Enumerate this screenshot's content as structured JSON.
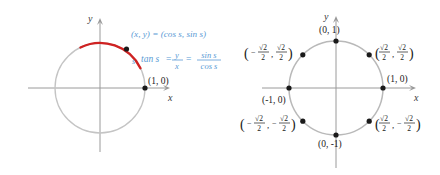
{
  "figure": {
    "colors": {
      "circle": "#bfbfbf",
      "axis": "#999999",
      "arc": "#d02020",
      "annotation_text": "#5b9bd5",
      "point": "#1a1a1a",
      "label_text": "#1a1a1a",
      "background": "#ffffff"
    }
  },
  "left_panel": {
    "name": "unit-circle-arc-diagram",
    "axes": {
      "x_label": "x",
      "y_label": "y"
    },
    "points": [
      {
        "id": "terminal-point",
        "label": "(x, y) = (cos s, sin s)",
        "x": -0.42,
        "y": 0.85
      },
      {
        "id": "initial-point",
        "label": "(1, 0)",
        "x": 1,
        "y": 0
      }
    ],
    "arc": {
      "label": "s",
      "from_angle_deg": 0,
      "to_angle_deg": 116
    },
    "formula": {
      "lhs": "tan s",
      "eq1": "=",
      "frac1_num": "y",
      "frac1_den": "x",
      "eq2": "=",
      "frac2_num": "sin s",
      "frac2_den": "cos s"
    }
  },
  "right_panel": {
    "name": "unit-circle-special-points-diagram",
    "axes": {
      "x_label": "x",
      "y_label": "y"
    },
    "points": [
      {
        "id": "pt-0-1",
        "label_lines": [
          "(0, 1)"
        ],
        "type": "plain",
        "x": 0,
        "y": 1
      },
      {
        "id": "pt-1-0",
        "label_lines": [
          "(1, 0)"
        ],
        "type": "plain",
        "x": 1,
        "y": 0
      },
      {
        "id": "pt-neg1-0",
        "label_lines": [
          "(-1, 0)"
        ],
        "type": "plain",
        "x": -1,
        "y": 0
      },
      {
        "id": "pt-0-neg1",
        "label_lines": [
          "(0, -1)"
        ],
        "type": "plain",
        "x": 0,
        "y": -1
      },
      {
        "id": "pt-q1",
        "num1": "√2",
        "den1": "2",
        "sign1": "",
        "num2": "√2",
        "den2": "2",
        "sign2": "",
        "type": "fraction",
        "x": 0.7071,
        "y": 0.7071
      },
      {
        "id": "pt-q2",
        "num1": "√2",
        "den1": "2",
        "sign1": "−",
        "num2": "√2",
        "den2": "2",
        "sign2": "",
        "type": "fraction",
        "x": -0.7071,
        "y": 0.7071
      },
      {
        "id": "pt-q3",
        "num1": "√2",
        "den1": "2",
        "sign1": "−",
        "num2": "√2",
        "den2": "2",
        "sign2": "−",
        "type": "fraction",
        "x": -0.7071,
        "y": -0.7071
      },
      {
        "id": "pt-q4",
        "num1": "√2",
        "den1": "2",
        "sign1": "",
        "num2": "√2",
        "den2": "2",
        "sign2": "−",
        "type": "fraction",
        "x": 0.7071,
        "y": -0.7071
      }
    ]
  }
}
